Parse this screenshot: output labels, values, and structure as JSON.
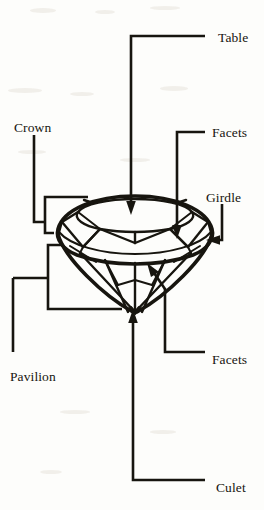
{
  "figure": {
    "background_color": "#fdfdfb",
    "ink_color": "#17150f"
  },
  "labels": [
    {
      "id": "table",
      "text": "Table",
      "x": 218,
      "y": 31,
      "anchor": "left"
    },
    {
      "id": "crown",
      "text": "Crown",
      "x": 14,
      "y": 121,
      "anchor": "left"
    },
    {
      "id": "facets-crown",
      "text": "Facets",
      "x": 212,
      "y": 126,
      "anchor": "left"
    },
    {
      "id": "girdle",
      "text": "Girdle",
      "x": 206,
      "y": 191,
      "anchor": "left"
    },
    {
      "id": "facets-pavilion",
      "text": "Facets",
      "x": 212,
      "y": 353,
      "anchor": "left"
    },
    {
      "id": "pavilion",
      "text": "Pavilion",
      "x": 10,
      "y": 370,
      "anchor": "left"
    },
    {
      "id": "culet",
      "text": "Culet",
      "x": 216,
      "y": 481,
      "anchor": "left"
    }
  ],
  "leaders": [
    {
      "id": "table-leader",
      "label": "Table",
      "kind": "elbow-arrow",
      "points": "205,36 131,36 131,206",
      "arrow": "down",
      "tip_x": 131,
      "tip_y": 214
    },
    {
      "id": "facets-crown-leader",
      "label": "Facets",
      "kind": "elbow-arrow",
      "points": "205,132 177,132 177,229",
      "arrow": "down",
      "tip_x": 177,
      "tip_y": 238
    },
    {
      "id": "girdle-leader",
      "label": "Girdle",
      "kind": "elbow-arrow",
      "points": "222,204 222,240 216,240",
      "arrow": "left",
      "tip_x": 207,
      "tip_y": 240
    },
    {
      "id": "crown-bracket",
      "label": "Crown",
      "kind": "bracket",
      "points": "88,197 45,197 45,233 53,233"
    },
    {
      "id": "crown-stem",
      "label": "Crown",
      "kind": "stem",
      "points": "34,135 34,222 45,222"
    },
    {
      "id": "pavilion-bracket",
      "label": "Pavilion",
      "kind": "bracket",
      "points": "62,245 48,245 48,309 122,309"
    },
    {
      "id": "pavilion-stem",
      "label": "Pavilion",
      "kind": "stem",
      "points": "35,278 35,352 48,278"
    },
    {
      "id": "facets-pavilion-leader",
      "label": "Facets",
      "kind": "elbow-arrow",
      "points": "205,352 165,352 165,288",
      "arrow": "up-left",
      "tip_x": 152,
      "tip_y": 268
    },
    {
      "id": "culet-leader",
      "label": "Culet",
      "kind": "elbow-arrow",
      "points": "205,480 133,480 133,320",
      "arrow": "up",
      "tip_x": 133,
      "tip_y": 310
    }
  ],
  "diamond": {
    "center_x": 135,
    "table_top_y": 206,
    "girdle_y": 243,
    "culet_y": 312,
    "half_width": 77,
    "parts": [
      "table",
      "crown facets",
      "girdle",
      "pavilion facets",
      "culet"
    ]
  }
}
